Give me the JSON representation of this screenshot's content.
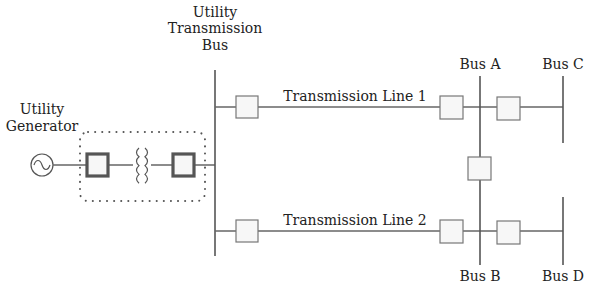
{
  "diagram": {
    "type": "single-line electrical diagram",
    "labels": {
      "generator": [
        "Utility",
        "Generator"
      ],
      "utility_bus": [
        "Utility",
        "Transmission",
        "Bus"
      ],
      "line1": "Transmission Line 1",
      "line2": "Transmission Line 2",
      "bus_a": "Bus A",
      "bus_b": "Bus B",
      "bus_c": "Bus C",
      "bus_d": "Bus D"
    },
    "components": [
      {
        "name": "utility-generator",
        "symbol": "ac-source-circle"
      },
      {
        "name": "generator-breaker",
        "symbol": "breaker-thick"
      },
      {
        "name": "step-up-transformer",
        "symbol": "transformer-coils"
      },
      {
        "name": "transformer-breaker",
        "symbol": "breaker-thick"
      },
      {
        "name": "line1-sending-breaker",
        "symbol": "breaker"
      },
      {
        "name": "line1-receiving-breaker",
        "symbol": "breaker"
      },
      {
        "name": "bus-a-to-c-breaker",
        "symbol": "breaker"
      },
      {
        "name": "bus-tie-breaker",
        "symbol": "breaker"
      },
      {
        "name": "line2-sending-breaker",
        "symbol": "breaker"
      },
      {
        "name": "line2-receiving-breaker",
        "symbol": "breaker"
      },
      {
        "name": "bus-b-to-d-breaker",
        "symbol": "breaker"
      }
    ],
    "colors": {
      "line": "#666666",
      "text": "#222222",
      "breaker_fill": "#f7f7f7"
    }
  }
}
